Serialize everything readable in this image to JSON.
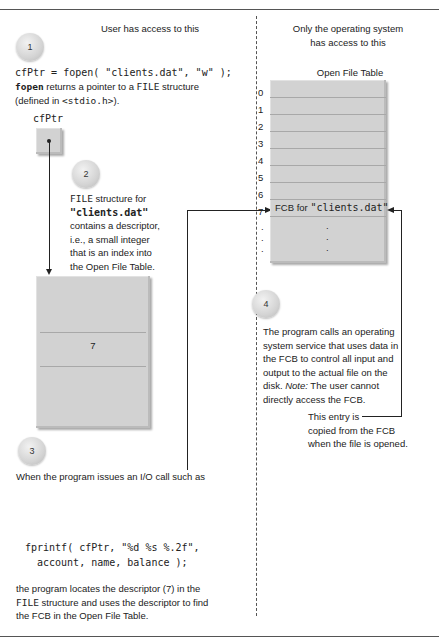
{
  "user_side": {
    "heading": "User has access to this",
    "step1": {
      "badge": "1",
      "code": "cfPtr = fopen( \"clients.dat\", \"w\" );",
      "desc_kw": "fopen",
      "desc_1": " returns a pointer to a ",
      "desc_kw2": "FILE",
      "desc_2": " structure",
      "desc_3a": "(defined in ",
      "desc_3kw": "<stdio.h>",
      "desc_3b": ")."
    },
    "pointer_label": "cfPtr",
    "step2": {
      "badge": "2",
      "kw": "FILE",
      "line1": " structure for",
      "line2": "\"clients.dat\"",
      "line3": "contains a descriptor,",
      "line4": "i.e., a small integer",
      "line5": "that is an index into",
      "line6": "the Open File Table."
    },
    "file_struct_descriptor": "7",
    "step3": {
      "badge": "3",
      "intro": "When the program issues an I/O call such as",
      "code1": "fprintf( cfPtr, \"%d %s %.2f\",",
      "code2": "account, name, balance );",
      "out1": "the program locates the descriptor (7) in the",
      "out2_kw": "FILE",
      "out2": " structure and uses the descriptor to find",
      "out3": "the FCB in the Open File Table."
    }
  },
  "os_side": {
    "heading_1": "Only the operating system",
    "heading_2": "has access to this",
    "table_title": "Open File Table",
    "rows": [
      "0",
      "1",
      "2",
      "3",
      "4",
      "5",
      "6",
      "7"
    ],
    "fcb_row_index": "7",
    "fcb_label": "FCB for ",
    "fcb_file": "\"clients.dat\"",
    "ellipsis": [
      ".",
      ".",
      "."
    ],
    "step4": {
      "badge": "4",
      "line1": "The program calls an operating",
      "line2": "system service that uses data in",
      "line3": "the FCB to control all input and",
      "line4": "output to the actual file on the",
      "line5a": "disk. ",
      "line5i": "Note:",
      "line5b": " The user cannot",
      "line6": "directly access the FCB."
    },
    "note": {
      "line1": "This entry is",
      "line2": "copied from the FCB",
      "line3": "when the file is opened."
    }
  }
}
